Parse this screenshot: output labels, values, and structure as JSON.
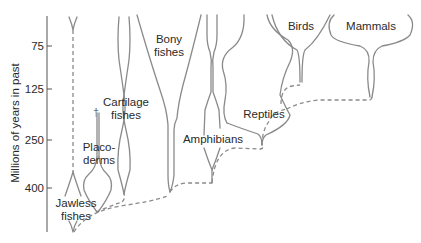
{
  "figure": {
    "title": "",
    "type": "evolutionary spindle diagram",
    "line_color": "#8a8a8a",
    "text_color": "#2a2a2a",
    "background": "#ffffff"
  },
  "axis": {
    "label": "Millions of years in past",
    "ticks": [
      {
        "value": "75",
        "y": 46
      },
      {
        "value": "125",
        "y": 89
      },
      {
        "value": "250",
        "y": 140
      },
      {
        "value": "400",
        "y": 188
      }
    ]
  },
  "groups": [
    {
      "name": "jawless-fishes",
      "lines": [
        "Jawless",
        "fishes"
      ]
    },
    {
      "name": "placoderms",
      "lines": [
        "Placo-",
        "derms"
      ]
    },
    {
      "name": "cartilage-fishes",
      "lines": [
        "Cartilage",
        "fishes"
      ]
    },
    {
      "name": "bony-fishes",
      "lines": [
        "Bony",
        "fishes"
      ]
    },
    {
      "name": "amphibians",
      "lines": [
        "Amphibians"
      ]
    },
    {
      "name": "reptiles",
      "lines": [
        "Reptiles"
      ]
    },
    {
      "name": "birds",
      "lines": [
        "Birds"
      ]
    },
    {
      "name": "mammals",
      "lines": [
        "Mammals"
      ]
    }
  ],
  "extinction_marker": "†"
}
